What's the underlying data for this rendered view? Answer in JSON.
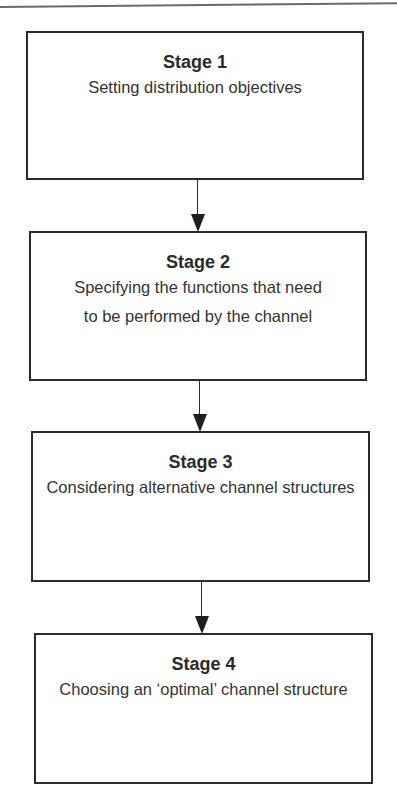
{
  "diagram": {
    "type": "flowchart",
    "direction": "top-to-bottom",
    "stages": [
      {
        "title": "Stage 1",
        "description": "Setting distribution objectives"
      },
      {
        "title": "Stage 2",
        "description": "Specifying the functions that need to be performed by the channel"
      },
      {
        "title": "Stage 3",
        "description": "Considering alternative channel structures"
      },
      {
        "title": "Stage 4",
        "description": "Choosing an ‘optimal’ channel structure"
      }
    ],
    "connections": [
      {
        "from": "Stage 1",
        "to": "Stage 2"
      },
      {
        "from": "Stage 2",
        "to": "Stage 3"
      },
      {
        "from": "Stage 3",
        "to": "Stage 4"
      }
    ],
    "colors": {
      "border": "#2b2b2b",
      "text": "#2a2a2a",
      "background": "#ffffff"
    }
  }
}
